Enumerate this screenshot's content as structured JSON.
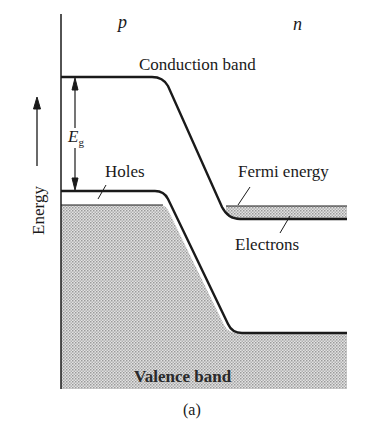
{
  "diagram": {
    "type": "band-diagram",
    "regions": {
      "left": "p",
      "right": "n"
    },
    "labels": {
      "conduction_band": "Conduction band",
      "valence_band": "Valence band",
      "fermi_energy": "Fermi energy",
      "holes": "Holes",
      "electrons": "Electrons",
      "band_gap": "E",
      "band_gap_sub": "g",
      "axis": "Energy",
      "caption": "(a)"
    },
    "colors": {
      "line": "#1a1a1a",
      "fill": "#c8c8c8",
      "background": "#ffffff"
    }
  }
}
